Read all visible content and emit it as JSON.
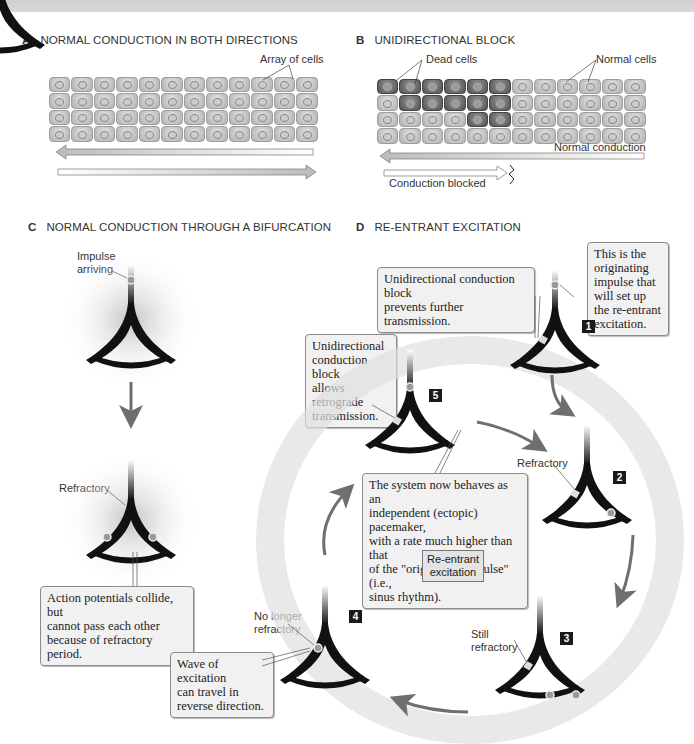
{
  "panels": {
    "a": {
      "letter": "A",
      "title": "NORMAL CONDUCTION IN BOTH DIRECTIONS",
      "labels": {
        "array_of_cells": "Array of cells"
      },
      "grid": {
        "rows": 4,
        "cols": 12
      }
    },
    "b": {
      "letter": "B",
      "title": "UNIDIRECTIONAL BLOCK",
      "labels": {
        "dead_cells": "Dead cells",
        "normal_cells": "Normal cells",
        "normal_conduction": "Normal conduction",
        "conduction_blocked": "Conduction blocked"
      },
      "grid": {
        "rows": 4,
        "cols": 12
      },
      "dead_cells": [
        [
          0,
          0
        ],
        [
          0,
          1
        ],
        [
          0,
          2
        ],
        [
          0,
          3
        ],
        [
          0,
          4
        ],
        [
          0,
          5
        ],
        [
          1,
          1
        ],
        [
          1,
          2
        ],
        [
          1,
          3
        ],
        [
          1,
          4
        ],
        [
          1,
          5
        ],
        [
          2,
          4
        ],
        [
          2,
          5
        ]
      ]
    },
    "c": {
      "letter": "C",
      "title": "NORMAL CONDUCTION THROUGH A BIFURCATION",
      "labels": {
        "impulse_arriving_1": "Impulse",
        "impulse_arriving_2": "arriving",
        "refractory": "Refractory"
      },
      "callout": {
        "line1": "Action potentials collide, but",
        "line2": "cannot pass each other",
        "line3": "because of refractory period."
      }
    },
    "d": {
      "letter": "D",
      "title": "RE-ENTRANT EXCITATION",
      "callouts": {
        "originating": {
          "line1": "This is the",
          "line2": "originating",
          "line3": "impulse that",
          "line4": "will set up",
          "line5": "the re-entrant",
          "line6": "excitation."
        },
        "prevents": {
          "line1": "Unidirectional conduction block",
          "line2": "prevents further transmission."
        },
        "retrograde": {
          "line1": "Unidirectional",
          "line2": "conduction block",
          "line3": "allows retrograde",
          "line4": "transmission."
        },
        "pacemaker": {
          "line1": "The system now behaves as an",
          "line2": "independent (ectopic) pacemaker,",
          "line3": "with a rate much higher than that",
          "line4": "of the \"originating impulse\" (i.e.,",
          "line5": "sinus rhythm)."
        },
        "reverse": {
          "line1": "Wave of excitation",
          "line2": "can travel in",
          "line3": "reverse direction."
        }
      },
      "center_label": {
        "line1": "Re-entrant",
        "line2": "excitation"
      },
      "labels": {
        "refractory": "Refractory",
        "still_refractory_1": "Still",
        "still_refractory_2": "refractory",
        "no_longer_1": "No longer",
        "no_longer_2": "refractory"
      },
      "steps": [
        "1",
        "2",
        "3",
        "4",
        "5"
      ]
    }
  },
  "colors": {
    "fiber": "#111111",
    "arrow": "#6f6f6f",
    "callout_bg": "#f1f1f1",
    "dead_cell": "#5a5a5a",
    "normal_cell": "#c8c8c8"
  }
}
